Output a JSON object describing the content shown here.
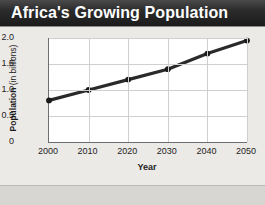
{
  "title": "Africa's Growing Population",
  "axis": {
    "y_title_strong": "Population",
    "y_title_rest": " (in billions)",
    "x_title": "Year"
  },
  "caption": "",
  "colors": {
    "title_bar": "#2b2b2b",
    "title_text": "#ffffff",
    "panel_bg": "#eceae7",
    "plot_bg": "#ffffff",
    "gridline": "#cfcfcf",
    "axis_line": "#6e6e6e",
    "series_line": "#2a2a2a",
    "marker": "#1a1a1a"
  },
  "chart_data": {
    "type": "line",
    "title": "Africa's Growing Population",
    "xlabel": "Year",
    "ylabel": "Population (in billions)",
    "x": [
      2000,
      2010,
      2020,
      2030,
      2040,
      2050
    ],
    "xtick_labels": [
      "2000",
      "2010",
      "2020",
      "2030",
      "2040",
      "2050"
    ],
    "ytick_labels": [
      "0",
      "0.5",
      "1.0",
      "1.5",
      "2.0"
    ],
    "ytick_values": [
      0,
      0.5,
      1.0,
      1.5,
      2.0
    ],
    "xlim": [
      2000,
      2050
    ],
    "ylim": [
      0,
      2.0
    ],
    "grid": true,
    "legend": false,
    "series": [
      {
        "name": "Population",
        "values": [
          0.8,
          1.0,
          1.2,
          1.4,
          1.7,
          1.95
        ]
      }
    ]
  }
}
